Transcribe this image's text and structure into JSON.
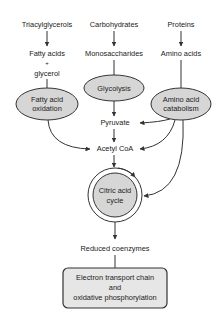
{
  "diagram": {
    "colors": {
      "node_fill": "#d6d6d6",
      "stroke": "#333333",
      "background": "#ffffff",
      "text": "#222222"
    },
    "sources": {
      "lipids": "Triacylglycerols",
      "carbs": "Carbohydrates",
      "proteins": "Proteins"
    },
    "monomers": {
      "fatty_acids": "Fatty acids",
      "plus": "+",
      "glycerol": "glycerol",
      "monosaccharides": "Monosaccharides",
      "amino_acids": "Amino acids"
    },
    "processes": {
      "fatty_acid_oxidation_1": "Fatty acid",
      "fatty_acid_oxidation_2": "oxidation",
      "glycolysis": "Glycolysis",
      "amino_acid_catabolism_1": "Amino acid",
      "amino_acid_catabolism_2": "catabolism",
      "citric_acid_cycle_1": "Citric acid",
      "citric_acid_cycle_2": "cycle"
    },
    "intermediates": {
      "pyruvate": "Pyruvate",
      "acetyl_coa": "Acetyl CoA",
      "reduced_coenzymes": "Reduced coenzymes"
    },
    "final": {
      "line1": "Electron transport chain",
      "line2": "and",
      "line3": "oxidative phosphorylation"
    },
    "edges": [
      {
        "from": "Triacylglycerols",
        "to": "Fatty acids + glycerol"
      },
      {
        "from": "Carbohydrates",
        "to": "Monosaccharides"
      },
      {
        "from": "Proteins",
        "to": "Amino acids"
      },
      {
        "from": "Fatty acids + glycerol",
        "to": "Fatty acid oxidation"
      },
      {
        "from": "Monosaccharides",
        "to": "Glycolysis"
      },
      {
        "from": "Amino acids",
        "to": "Amino acid catabolism"
      },
      {
        "from": "Glycolysis",
        "to": "Pyruvate"
      },
      {
        "from": "Amino acid catabolism",
        "to": "Pyruvate"
      },
      {
        "from": "Pyruvate",
        "to": "Acetyl CoA"
      },
      {
        "from": "Fatty acid oxidation",
        "to": "Acetyl CoA"
      },
      {
        "from": "Amino acid catabolism",
        "to": "Acetyl CoA"
      },
      {
        "from": "Amino acid catabolism",
        "to": "Citric acid cycle"
      },
      {
        "from": "Acetyl CoA",
        "to": "Citric acid cycle"
      },
      {
        "from": "Citric acid cycle",
        "to": "Reduced coenzymes"
      },
      {
        "from": "Reduced coenzymes",
        "to": "Electron transport chain and oxidative phosphorylation"
      }
    ]
  }
}
